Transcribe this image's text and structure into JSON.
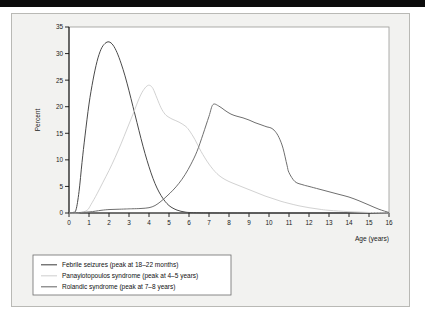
{
  "figure": {
    "background_color": "#f2f2f0",
    "plot_background_color": "#ffffff",
    "top_rule_color": "#0b0b0b"
  },
  "chart_data": {
    "type": "line",
    "title": "",
    "subtitle": "",
    "xlabel": "Age (years)",
    "ylabel": "Percent",
    "xlim": [
      0,
      16
    ],
    "ylim": [
      0,
      35
    ],
    "xticks": [
      0,
      1,
      2,
      3,
      4,
      5,
      6,
      7,
      8,
      9,
      10,
      11,
      12,
      13,
      14,
      15,
      16
    ],
    "yticks": [
      0,
      5,
      10,
      15,
      20,
      25,
      30,
      35
    ],
    "xtick_labels": [
      "0",
      "1",
      "2",
      "3",
      "4",
      "5",
      "6",
      "7",
      "8",
      "9",
      "10",
      "11",
      "12",
      "13",
      "14",
      "15",
      "16"
    ],
    "ytick_labels": [
      "0",
      "5",
      "10",
      "15",
      "20",
      "25",
      "30",
      "35"
    ],
    "grid": false,
    "legend_position": "below-left",
    "series": [
      {
        "name": "Febrile seizures (peak at 18–22 months)",
        "color": "#4a4a4a",
        "peak_x": 2.0,
        "peak_y": 32.2,
        "x": [
          0.0,
          0.2,
          0.35,
          0.5,
          0.65,
          0.8,
          1.0,
          1.2,
          1.4,
          1.6,
          1.8,
          2.0,
          2.2,
          2.4,
          2.6,
          2.8,
          3.0,
          3.2,
          3.4,
          3.6,
          3.8,
          4.0,
          4.2,
          4.4,
          4.6,
          4.8,
          5.0,
          5.2,
          5.4,
          5.6,
          5.8,
          6.0,
          6.5,
          7.0,
          8.0,
          10.0,
          12.0,
          14.0,
          16.0
        ],
        "y": [
          0.0,
          0.1,
          0.6,
          4.0,
          9.5,
          14.5,
          20.5,
          25.0,
          28.5,
          30.8,
          31.9,
          32.2,
          31.6,
          30.2,
          28.2,
          25.8,
          23.0,
          20.0,
          17.0,
          14.0,
          11.2,
          8.7,
          6.5,
          4.7,
          3.3,
          2.2,
          1.4,
          0.9,
          0.55,
          0.32,
          0.18,
          0.1,
          0.04,
          0.02,
          0.0,
          0.0,
          0.0,
          0.0,
          0.0
        ]
      },
      {
        "name": "Panayiotopoulos syndrome (peak at 4–5 years)",
        "color": "#d2d2d2",
        "peak_x": 4.0,
        "peak_y": 24.0,
        "x": [
          0.0,
          0.5,
          0.9,
          1.1,
          1.4,
          1.7,
          2.0,
          2.3,
          2.6,
          2.9,
          3.2,
          3.5,
          3.7,
          3.9,
          4.05,
          4.2,
          4.4,
          4.6,
          4.8,
          5.0,
          5.2,
          5.5,
          5.8,
          6.0,
          6.3,
          6.6,
          7.0,
          7.4,
          7.8,
          8.2,
          8.6,
          9.0,
          9.4,
          9.8,
          10.2,
          10.6,
          11.0,
          11.5,
          12.0,
          12.5,
          13.0,
          14.0,
          15.0,
          16.0
        ],
        "y": [
          0.0,
          0.05,
          0.5,
          1.6,
          3.6,
          5.8,
          8.0,
          10.4,
          13.0,
          15.8,
          18.6,
          21.5,
          23.0,
          23.9,
          24.0,
          23.4,
          21.6,
          19.8,
          18.6,
          18.0,
          17.6,
          17.1,
          16.4,
          15.6,
          13.8,
          11.6,
          9.2,
          7.4,
          6.3,
          5.6,
          5.0,
          4.4,
          3.8,
          3.2,
          2.7,
          2.2,
          1.8,
          1.35,
          1.0,
          0.72,
          0.5,
          0.25,
          0.1,
          0.0
        ]
      },
      {
        "name": "Rolandic syndrome (peak at 7–8 years)",
        "color": "#6f6f6f",
        "peak_x": 7.2,
        "peak_y": 20.4,
        "x": [
          0.0,
          1.0,
          1.6,
          2.0,
          2.4,
          2.8,
          3.0,
          3.2,
          3.6,
          4.0,
          4.3,
          4.6,
          4.9,
          5.2,
          5.5,
          5.8,
          6.1,
          6.4,
          6.7,
          7.0,
          7.2,
          7.5,
          7.8,
          8.1,
          8.4,
          8.7,
          9.0,
          9.3,
          9.6,
          9.9,
          10.1,
          10.3,
          10.5,
          10.7,
          10.9,
          11.0,
          11.3,
          11.7,
          12.0,
          12.5,
          13.0,
          13.5,
          14.0,
          14.5,
          15.0,
          15.5,
          16.0
        ],
        "y": [
          0.0,
          0.2,
          0.5,
          0.65,
          0.7,
          0.75,
          0.78,
          0.8,
          0.85,
          1.0,
          1.4,
          2.2,
          3.2,
          4.3,
          5.6,
          7.2,
          9.2,
          11.6,
          14.8,
          18.2,
          20.4,
          20.1,
          19.3,
          18.6,
          18.2,
          17.9,
          17.5,
          17.0,
          16.6,
          16.2,
          16.0,
          15.4,
          14.2,
          12.2,
          9.0,
          7.6,
          5.9,
          5.3,
          5.0,
          4.5,
          4.0,
          3.5,
          3.0,
          2.3,
          1.5,
          0.7,
          0.1
        ]
      }
    ]
  },
  "legend": {
    "items": [
      {
        "label": "Febrile seizures (peak at 18–22 months)",
        "color": "#4a4a4a"
      },
      {
        "label": "Panayiotopoulos syndrome (peak at 4–5 years)",
        "color": "#d2d2d2"
      },
      {
        "label": "Rolandic syndrome (peak at 7–8 years)",
        "color": "#6f6f6f"
      }
    ]
  }
}
